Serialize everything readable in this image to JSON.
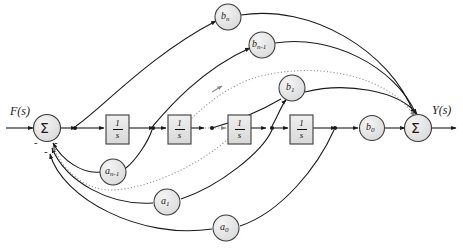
{
  "figure": {
    "type": "block-diagram"
  },
  "io": {
    "input_label": "F(s)",
    "output_label": "Y(s)"
  },
  "summing_junctions": [
    {
      "id": "sum-left",
      "label": "Σ",
      "x": 47,
      "y": 128
    },
    {
      "id": "sum-right",
      "label": "Σ",
      "x": 418,
      "y": 128
    }
  ],
  "sign_marks": [
    {
      "label": "-",
      "x": 37,
      "y": 143
    },
    {
      "label": "-",
      "x": 57,
      "y": 143
    },
    {
      "label": "-",
      "x": 47,
      "y": 152
    }
  ],
  "integrator_blocks": [
    {
      "id": "int-1",
      "numerator": "1",
      "denominator": "s",
      "x": 106,
      "y": 115,
      "w": 23,
      "h": 29
    },
    {
      "id": "int-2",
      "numerator": "1",
      "denominator": "s",
      "x": 168,
      "y": 115,
      "w": 23,
      "h": 29
    },
    {
      "id": "int-3",
      "numerator": "1",
      "denominator": "s",
      "x": 228,
      "y": 115,
      "w": 23,
      "h": 29
    },
    {
      "id": "int-4",
      "numerator": "1",
      "denominator": "s",
      "x": 290,
      "y": 115,
      "w": 23,
      "h": 29
    }
  ],
  "feedforward_gains": [
    {
      "id": "b-n",
      "base": "b",
      "subscript": "n",
      "x": 228,
      "y": 17,
      "r": 13
    },
    {
      "id": "b-n-1",
      "base": "b",
      "subscript": "n-1",
      "x": 262,
      "y": 45,
      "r": 13
    },
    {
      "id": "b-1",
      "base": "b",
      "subscript": "1",
      "x": 292,
      "y": 88,
      "r": 13
    },
    {
      "id": "b-0",
      "base": "b",
      "subscript": "0",
      "x": 372,
      "y": 128,
      "r": 12
    }
  ],
  "feedback_gains": [
    {
      "id": "a-n-1",
      "base": "a",
      "subscript": "n-1",
      "x": 113,
      "y": 172,
      "r": 13
    },
    {
      "id": "a-1",
      "base": "a",
      "subscript": "1",
      "x": 167,
      "y": 202,
      "r": 13
    },
    {
      "id": "a-0",
      "base": "a",
      "subscript": "0",
      "x": 226,
      "y": 228,
      "r": 13
    }
  ],
  "pickoff_nodes": [
    {
      "id": "node-0",
      "x": 74,
      "y": 128
    },
    {
      "id": "node-1",
      "x": 152,
      "y": 128
    },
    {
      "id": "node-2",
      "x": 212,
      "y": 128
    },
    {
      "id": "node-3",
      "x": 272,
      "y": 128
    },
    {
      "id": "node-4",
      "x": 334,
      "y": 128
    }
  ],
  "ellipsis_paths": [
    {
      "id": "dotted-forward",
      "description": "dotted continuation of feedforward branches"
    },
    {
      "id": "dotted-feedback",
      "description": "dotted continuation of feedback branches"
    },
    {
      "id": "dotted-main",
      "description": "dotted segment of main forward path between integrators"
    }
  ],
  "colors": {
    "line": "#1a1a1a",
    "block_fill": "#e3e3e3",
    "block_stroke": "#4a4a4a",
    "circle_fill": "#e3e3e3",
    "circle_stroke": "#3a3a3a",
    "dotted": "#8a8a8a",
    "background": "#ffffff"
  }
}
